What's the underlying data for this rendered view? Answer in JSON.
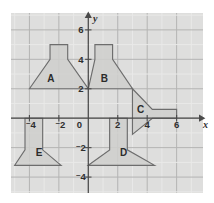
{
  "figure": {
    "background_color": "#ffffff",
    "plot_background_color": "#dededd",
    "grid_minor_color": "#e9e9e8",
    "grid_major_color": "#b4b4b3",
    "axis_color": "#4a4a4a",
    "shape_fill_color": "#cfcfcd",
    "shape_stroke_color": "#6d6d6d"
  },
  "chart_data": {
    "type": "scatter",
    "title": "",
    "xlabel": "x",
    "ylabel": "y",
    "xlim": [
      -5.25,
      7.0
    ],
    "ylim": [
      -5.25,
      7.0
    ],
    "grid": true,
    "grid_step": 1,
    "legend": "none",
    "x_ticks": [
      {
        "value": -4,
        "label": "4",
        "negative": true
      },
      {
        "value": -2,
        "label": "2",
        "negative": true
      },
      {
        "value": 0,
        "label": "0",
        "negative": false
      },
      {
        "value": 2,
        "label": "2",
        "negative": false
      },
      {
        "value": 4,
        "label": "4",
        "negative": false
      },
      {
        "value": 6,
        "label": "6",
        "negative": false
      }
    ],
    "y_ticks": [
      {
        "value": 6,
        "label": "6",
        "negative": false
      },
      {
        "value": 4,
        "label": "4",
        "negative": false
      },
      {
        "value": 2,
        "label": "2",
        "negative": false
      },
      {
        "value": -2,
        "label": "2",
        "negative": true
      },
      {
        "value": -4,
        "label": "4",
        "negative": true
      }
    ],
    "axis_labels": {
      "x": "x",
      "y": "y"
    },
    "shapes": [
      {
        "id": "A",
        "label": "A",
        "label_point": [
          -2.55,
          2.45
        ],
        "orientation": "up",
        "points": [
          [
            -4,
            2
          ],
          [
            -2.6,
            4
          ],
          [
            -2.6,
            5
          ],
          [
            -1.4,
            5
          ],
          [
            -1.4,
            4
          ],
          [
            0,
            2
          ]
        ]
      },
      {
        "id": "B",
        "label": "B",
        "label_point": [
          1.1,
          2.45
        ],
        "orientation": "up",
        "points": [
          [
            0,
            2
          ],
          [
            0.45,
            4
          ],
          [
            0.45,
            5
          ],
          [
            1.65,
            5
          ],
          [
            1.65,
            4
          ],
          [
            3,
            2
          ]
        ]
      },
      {
        "id": "C",
        "label": "C",
        "label_point": [
          3.55,
          0.35
        ],
        "orientation": "right",
        "points": [
          [
            3,
            2
          ],
          [
            4.35,
            0.6
          ],
          [
            6,
            0.6
          ],
          [
            6,
            0
          ],
          [
            4.35,
            0
          ],
          [
            3,
            -1.1
          ]
        ]
      },
      {
        "id": "D",
        "label": "D",
        "label_point": [
          2.4,
          -2.6
        ],
        "orientation": "down",
        "points": [
          [
            0,
            -3.2
          ],
          [
            1.45,
            -2.15
          ],
          [
            1.45,
            0
          ],
          [
            2.65,
            0
          ],
          [
            2.65,
            -2.15
          ],
          [
            4.5,
            -3.2
          ]
        ]
      },
      {
        "id": "E",
        "label": "E",
        "label_point": [
          -3.35,
          -2.6
        ],
        "orientation": "down",
        "points": [
          [
            -5,
            -3.2
          ],
          [
            -4.3,
            -2.15
          ],
          [
            -4.3,
            0
          ],
          [
            -3.1,
            0
          ],
          [
            -3.1,
            -2.15
          ],
          [
            -1.85,
            -3.2
          ]
        ]
      }
    ]
  }
}
